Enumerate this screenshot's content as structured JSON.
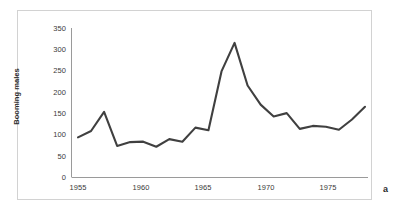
{
  "figure": {
    "panel_letter": "a",
    "background_color": "#ffffff",
    "frame_color": "#d2d2d2"
  },
  "chart_data": {
    "type": "line",
    "title": "",
    "subtitle": "",
    "xlabel": "",
    "ylabel": "Booming males",
    "x": [
      1955,
      1956,
      1957,
      1958,
      1959,
      1960,
      1961,
      1962,
      1963,
      1964,
      1965,
      1966,
      1967,
      1968,
      1969,
      1970,
      1971,
      1972,
      1973,
      1974,
      1975,
      1976,
      1977
    ],
    "values": [
      93,
      108,
      153,
      73,
      82,
      83,
      71,
      89,
      83,
      116,
      110,
      248,
      315,
      215,
      170,
      142,
      150,
      113,
      120,
      118,
      111,
      135,
      165
    ],
    "series": [
      {
        "name": "Booming males",
        "values": [
          93,
          108,
          153,
          73,
          82,
          83,
          71,
          89,
          83,
          116,
          110,
          248,
          315,
          215,
          170,
          142,
          150,
          113,
          120,
          118,
          111,
          135,
          165
        ],
        "color": "#404040"
      }
    ],
    "xlim": [
      1955,
      1977
    ],
    "ylim": [
      0,
      350
    ],
    "ytick_labels": [
      "0",
      "50",
      "100",
      "150",
      "200",
      "250",
      "300",
      "350"
    ],
    "ytick_values": [
      0,
      50,
      100,
      150,
      200,
      250,
      300,
      350
    ],
    "xtick_labels": [
      "1955",
      "1960",
      "1965",
      "1970",
      "1975"
    ],
    "xtick_values": [
      1955,
      1960,
      1965,
      1970,
      1975
    ],
    "grid": false,
    "legend": false,
    "legend_position": "none",
    "line_color": "#404040",
    "axis_color": "#9a9a9a",
    "markers": false
  }
}
